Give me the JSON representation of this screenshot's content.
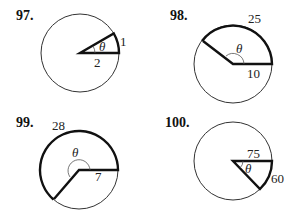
{
  "problems": [
    {
      "number": "97.",
      "theta": "θ",
      "radius_label": "2",
      "arc_label": "1"
    },
    {
      "number": "98.",
      "theta": "θ",
      "radius_label": "10",
      "arc_label": "25"
    },
    {
      "number": "99.",
      "theta": "θ",
      "radius_label": "7",
      "arc_label": "28"
    },
    {
      "number": "100.",
      "theta": "θ",
      "radius_label": "75",
      "arc_label": "60"
    }
  ]
}
